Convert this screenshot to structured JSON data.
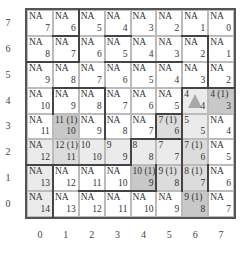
{
  "gridworld": {
    "cols": 8,
    "rows": 8,
    "x_labels": [
      "0",
      "1",
      "2",
      "3",
      "4",
      "5",
      "6",
      "7"
    ],
    "y_labels": [
      "0",
      "1",
      "2",
      "3",
      "4",
      "5",
      "6",
      "7"
    ],
    "shade_colors": {
      "none": "#ffffff",
      "light": "#ebebeb",
      "mid": "#dcdcdc",
      "dark": "#c8c8c8"
    },
    "cells": [
      [
        {
          "q": "NA",
          "v": "14",
          "shade": "light"
        },
        {
          "q": "NA",
          "v": "13",
          "shade": "none"
        },
        {
          "q": "NA",
          "v": "12",
          "shade": "none"
        },
        {
          "q": "NA",
          "v": "11",
          "shade": "none"
        },
        {
          "q": "NA",
          "v": "10",
          "shade": "none"
        },
        {
          "q": "NA",
          "v": "9",
          "shade": "none"
        },
        {
          "q": "9 (1)",
          "v": "8",
          "shade": "dark"
        },
        {
          "q": "NA",
          "v": "7",
          "shade": "none"
        }
      ],
      [
        {
          "q": "NA",
          "v": "13",
          "shade": "light"
        },
        {
          "q": "NA",
          "v": "12",
          "shade": "none"
        },
        {
          "q": "NA",
          "v": "11",
          "shade": "none"
        },
        {
          "q": "NA",
          "v": "10",
          "shade": "none"
        },
        {
          "q": "10 (1)",
          "v": "9",
          "shade": "dark"
        },
        {
          "q": "9 (1)",
          "v": "8",
          "shade": "mid"
        },
        {
          "q": "8 (1)",
          "v": "7",
          "shade": "mid"
        },
        {
          "q": "NA",
          "v": "6",
          "shade": "none"
        }
      ],
      [
        {
          "q": "NA",
          "v": "12",
          "shade": "light"
        },
        {
          "q": "12 (1)",
          "v": "11",
          "shade": "mid"
        },
        {
          "q": "10",
          "v": "10",
          "shade": "light"
        },
        {
          "q": "9",
          "v": "9",
          "shade": "light"
        },
        {
          "q": "8",
          "v": "8",
          "shade": "light"
        },
        {
          "q": "7",
          "v": "7",
          "shade": "light"
        },
        {
          "q": "7 (1)",
          "v": "6",
          "shade": "mid"
        },
        {
          "q": "NA",
          "v": "5",
          "shade": "none"
        }
      ],
      [
        {
          "q": "NA",
          "v": "11",
          "shade": "none"
        },
        {
          "q": "11 (1)",
          "v": "10",
          "shade": "dark"
        },
        {
          "q": "NA",
          "v": "9",
          "shade": "none"
        },
        {
          "q": "NA",
          "v": "8",
          "shade": "none"
        },
        {
          "q": "NA",
          "v": "7",
          "shade": "none"
        },
        {
          "q": "7 (1)",
          "v": "6",
          "shade": "mid"
        },
        {
          "q": "5",
          "v": "5",
          "shade": "light"
        },
        {
          "q": "NA",
          "v": "4",
          "shade": "none"
        }
      ],
      [
        {
          "q": "NA",
          "v": "10",
          "shade": "none"
        },
        {
          "q": "NA",
          "v": "9",
          "shade": "none"
        },
        {
          "q": "NA",
          "v": "8",
          "shade": "none"
        },
        {
          "q": "NA",
          "v": "7",
          "shade": "none"
        },
        {
          "q": "NA",
          "v": "6",
          "shade": "none"
        },
        {
          "q": "NA",
          "v": "5",
          "shade": "none"
        },
        {
          "q": "4",
          "v": "4",
          "shade": "light",
          "goal": true
        },
        {
          "q": "4 (1)",
          "v": "3",
          "shade": "dark"
        }
      ],
      [
        {
          "q": "NA",
          "v": "9",
          "shade": "none"
        },
        {
          "q": "NA",
          "v": "8",
          "shade": "none"
        },
        {
          "q": "NA",
          "v": "7",
          "shade": "none"
        },
        {
          "q": "NA",
          "v": "6",
          "shade": "none"
        },
        {
          "q": "NA",
          "v": "5",
          "shade": "none"
        },
        {
          "q": "NA",
          "v": "4",
          "shade": "none"
        },
        {
          "q": "NA",
          "v": "3",
          "shade": "none"
        },
        {
          "q": "NA",
          "v": "2",
          "shade": "none"
        }
      ],
      [
        {
          "q": "NA",
          "v": "8",
          "shade": "none"
        },
        {
          "q": "NA",
          "v": "7",
          "shade": "none"
        },
        {
          "q": "NA",
          "v": "6",
          "shade": "none"
        },
        {
          "q": "NA",
          "v": "5",
          "shade": "none"
        },
        {
          "q": "NA",
          "v": "4",
          "shade": "none"
        },
        {
          "q": "NA",
          "v": "3",
          "shade": "none"
        },
        {
          "q": "NA",
          "v": "2",
          "shade": "none"
        },
        {
          "q": "NA",
          "v": "1",
          "shade": "none"
        }
      ],
      [
        {
          "q": "NA",
          "v": "7",
          "shade": "none"
        },
        {
          "q": "NA",
          "v": "6",
          "shade": "none"
        },
        {
          "q": "NA",
          "v": "5",
          "shade": "none"
        },
        {
          "q": "NA",
          "v": "4",
          "shade": "none"
        },
        {
          "q": "NA",
          "v": "3",
          "shade": "none"
        },
        {
          "q": "NA",
          "v": "2",
          "shade": "none"
        },
        {
          "q": "NA",
          "v": "1",
          "shade": "none"
        },
        {
          "q": "NA",
          "v": "0",
          "shade": "none"
        }
      ]
    ],
    "walls_h": [
      {
        "row_boundary": 7,
        "x0": 1,
        "x1": 2
      },
      {
        "row_boundary": 7,
        "x0": 3,
        "x1": 4
      },
      {
        "row_boundary": 7,
        "x0": 6,
        "x1": 7
      },
      {
        "row_boundary": 6,
        "x0": 0,
        "x1": 2
      },
      {
        "row_boundary": 6,
        "x0": 3,
        "x1": 6
      },
      {
        "row_boundary": 5,
        "x0": 1,
        "x1": 3
      },
      {
        "row_boundary": 5,
        "x0": 6,
        "x1": 8
      },
      {
        "row_boundary": 4,
        "x0": 5,
        "x1": 6
      },
      {
        "row_boundary": 3,
        "x0": 4,
        "x1": 6
      },
      {
        "row_boundary": 2,
        "x0": 0,
        "x1": 1
      },
      {
        "row_boundary": 2,
        "x0": 1,
        "x1": 4
      },
      {
        "row_boundary": 1,
        "x0": 2,
        "x1": 5
      }
    ],
    "walls_v": [
      {
        "col_boundary": 2,
        "y0": 6,
        "y1": 8
      },
      {
        "col_boundary": 7,
        "y0": 5,
        "y1": 7
      },
      {
        "col_boundary": 3,
        "y0": 4,
        "y1": 5
      },
      {
        "col_boundary": 1,
        "y0": 4,
        "y1": 5
      },
      {
        "col_boundary": 6,
        "y0": 3,
        "y1": 5
      },
      {
        "col_boundary": 3,
        "y0": 3,
        "y1": 4
      },
      {
        "col_boundary": 5,
        "y0": 3,
        "y1": 4
      },
      {
        "col_boundary": 4,
        "y0": 2,
        "y1": 3
      },
      {
        "col_boundary": 6,
        "y0": 1,
        "y1": 3
      },
      {
        "col_boundary": 7,
        "y0": 1,
        "y1": 2
      },
      {
        "col_boundary": 1,
        "y0": 0,
        "y1": 2
      },
      {
        "col_boundary": 5,
        "y0": 1,
        "y1": 2
      }
    ]
  }
}
